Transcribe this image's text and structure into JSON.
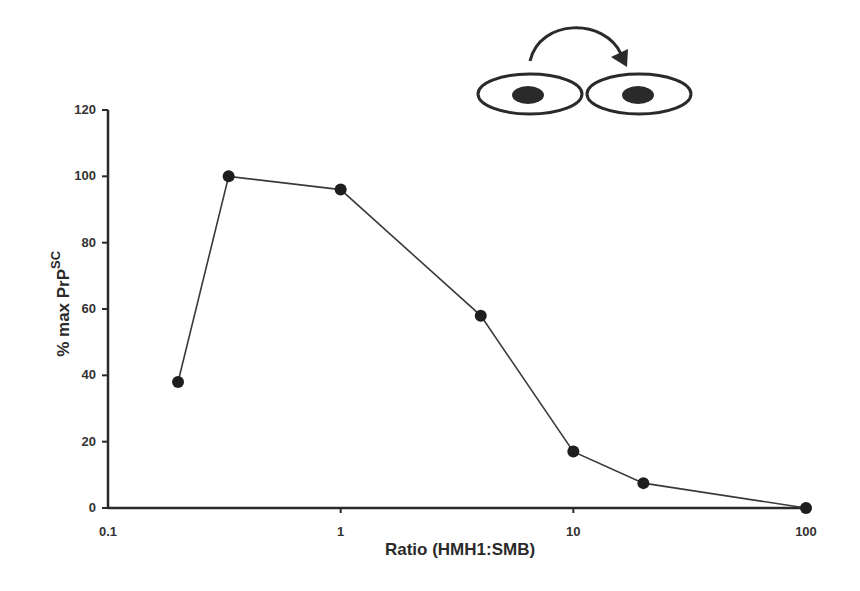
{
  "chart_data": {
    "type": "line",
    "title": "",
    "xlabel": "Ratio (HMH1:SMB)",
    "ylabel": "% max PrP",
    "ylabel_superscript": "SC",
    "x_scale": "log",
    "xlim": [
      0.1,
      100
    ],
    "ylim": [
      0,
      120
    ],
    "x_ticks": [
      "0.1",
      "1",
      "10",
      "100"
    ],
    "y_ticks": [
      "0",
      "20",
      "40",
      "60",
      "80",
      "100",
      "120"
    ],
    "grid": false,
    "legend": null,
    "series": [
      {
        "name": "% max PrPSC",
        "marker": "filled-circle",
        "color": "#222222",
        "x": [
          0.2,
          0.33,
          1,
          4,
          10,
          20,
          100
        ],
        "y": [
          38,
          100,
          96,
          58,
          17,
          7.5,
          0
        ]
      }
    ],
    "annotations": [
      {
        "type": "diagram",
        "description": "two adjacent cells (ellipses with dark nuclei) with curved arrow pointing from left cell to right cell"
      }
    ]
  },
  "axes": {
    "xlabel": "Ratio (HMH1:SMB)",
    "ylabel_main": "% max PrP",
    "ylabel_sup": "SC",
    "x_ticks": [
      {
        "label": "0.1",
        "value": 0.1
      },
      {
        "label": "1",
        "value": 1
      },
      {
        "label": "10",
        "value": 10
      },
      {
        "label": "100",
        "value": 100
      }
    ],
    "y_ticks": [
      {
        "label": "0",
        "value": 0
      },
      {
        "label": "20",
        "value": 20
      },
      {
        "label": "40",
        "value": 40
      },
      {
        "label": "60",
        "value": 60
      },
      {
        "label": "80",
        "value": 80
      },
      {
        "label": "100",
        "value": 100
      },
      {
        "label": "120",
        "value": 120
      }
    ]
  },
  "colors": {
    "line": "#3a3a3a",
    "marker": "#1e1e1e",
    "axis": "#2a2a2a"
  }
}
